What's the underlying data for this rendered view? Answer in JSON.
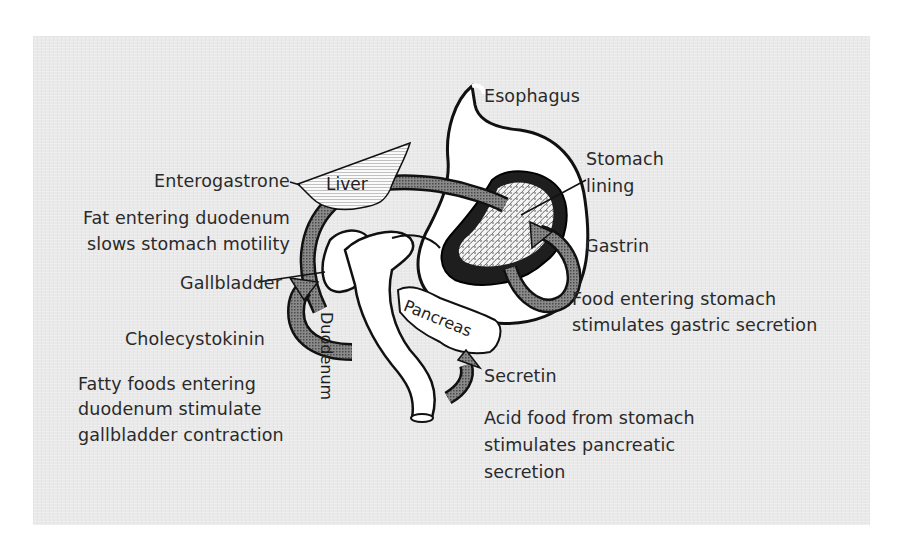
{
  "diagram": {
    "colors": {
      "background": "#ffffff",
      "panel": "#e9e9e9",
      "outline": "#111111",
      "organ_fill": "#ffffff",
      "hormone_pathway": "#6e6e6e",
      "text": "#2a2a2a"
    },
    "organs": {
      "esophagus": "Esophagus",
      "stomach_lining": [
        "Stomach",
        "lining"
      ],
      "liver": "Liver",
      "gallbladder": "Gallbladder",
      "duodenum": "Duodenum",
      "pancreas": "Pancreas"
    },
    "hormones": [
      {
        "name": "Enterogastrone",
        "description": [
          "Fat entering duodenum",
          "slows stomach motility"
        ]
      },
      {
        "name": "Gastrin",
        "description": [
          "Food entering stomach",
          "stimulates gastric secretion"
        ]
      },
      {
        "name": "Cholecystokinin",
        "description": [
          "Fatty foods entering",
          "duodenum stimulate",
          "gallbladder contraction"
        ]
      },
      {
        "name": "Secretin",
        "description": [
          "Acid food from stomach",
          "stimulates pancreatic",
          "secretion"
        ]
      }
    ]
  }
}
